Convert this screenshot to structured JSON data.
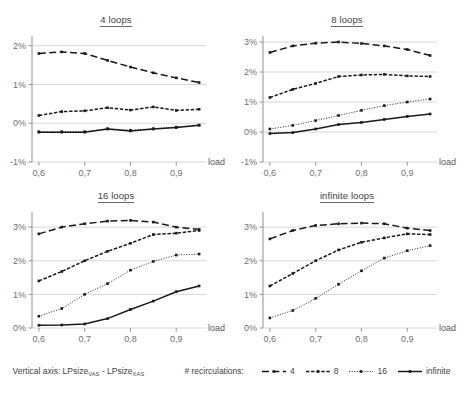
{
  "figure": {
    "legend": {
      "vertical_axis_text_prefix": "Vertical axis: LPsize",
      "vertical_axis_sub1": "VAS",
      "vertical_axis_middle": " - LPsize",
      "vertical_axis_sub2": "XAS",
      "recirculations_label": "# recirculations:",
      "entries": [
        {
          "label": "4",
          "style": "dashed"
        },
        {
          "label": "8",
          "style": "dash-dot"
        },
        {
          "label": "16",
          "style": "dotted"
        },
        {
          "label": "infinite",
          "style": "solid"
        }
      ]
    },
    "series_styles": {
      "4": "dashed",
      "8": "dash-dot",
      "16": "dotted",
      "infinite": "solid"
    },
    "color": "#1a1a1a",
    "gridline_color": "#d6d6d6",
    "axis_color": "#9a9a9a"
  },
  "chart_data": [
    {
      "type": "line",
      "title": "4 loops",
      "xlabel": "load",
      "ylabel": "",
      "x": [
        0.6,
        0.65,
        0.7,
        0.75,
        0.8,
        0.85,
        0.9,
        0.95
      ],
      "xticks": [
        "0,6",
        "0,7",
        "0,8",
        "0,9"
      ],
      "xtick_values": [
        0.6,
        0.7,
        0.8,
        0.9
      ],
      "xlim": [
        0.585,
        0.965
      ],
      "yticks": [
        "-1%",
        "0%",
        "1%",
        "2%"
      ],
      "ytick_values": [
        -1,
        0,
        1,
        2
      ],
      "ylim": [
        -1,
        2.25
      ],
      "grid": true,
      "legend_position": "figure-bottom",
      "series": [
        {
          "name": "4",
          "values": [
            1.8,
            1.84,
            1.8,
            1.62,
            1.45,
            1.3,
            1.17,
            1.05
          ]
        },
        {
          "name": "8",
          "values": [
            0.2,
            0.3,
            0.32,
            0.4,
            0.34,
            0.42,
            0.33,
            0.36
          ]
        },
        {
          "name": "16",
          "values": [
            -0.22,
            -0.22,
            -0.22,
            -0.14,
            -0.18,
            -0.14,
            -0.1,
            -0.05
          ]
        },
        {
          "name": "infinite",
          "values": [
            -0.23,
            -0.23,
            -0.23,
            -0.15,
            -0.2,
            -0.15,
            -0.11,
            -0.05
          ]
        }
      ]
    },
    {
      "type": "line",
      "title": "8 loops",
      "xlabel": "load",
      "ylabel": "",
      "x": [
        0.6,
        0.65,
        0.7,
        0.75,
        0.8,
        0.85,
        0.9,
        0.95
      ],
      "xticks": [
        "0,6",
        "0,7",
        "0,8",
        "0,9"
      ],
      "xtick_values": [
        0.6,
        0.7,
        0.8,
        0.9
      ],
      "xlim": [
        0.585,
        0.965
      ],
      "yticks": [
        "-1%",
        "0%",
        "1%",
        "2%",
        "3%"
      ],
      "ytick_values": [
        -1,
        0,
        1,
        2,
        3
      ],
      "ylim": [
        -1,
        3.2
      ],
      "grid": true,
      "legend_position": "figure-bottom",
      "series": [
        {
          "name": "4",
          "values": [
            2.65,
            2.87,
            2.96,
            3.0,
            2.95,
            2.87,
            2.75,
            2.55
          ]
        },
        {
          "name": "8",
          "values": [
            1.15,
            1.42,
            1.62,
            1.85,
            1.9,
            1.92,
            1.87,
            1.85
          ]
        },
        {
          "name": "16",
          "values": [
            0.1,
            0.22,
            0.38,
            0.55,
            0.72,
            0.88,
            1.0,
            1.1
          ]
        },
        {
          "name": "infinite",
          "values": [
            -0.05,
            -0.02,
            0.1,
            0.25,
            0.32,
            0.42,
            0.52,
            0.6
          ]
        }
      ]
    },
    {
      "type": "line",
      "title": "16 loops",
      "xlabel": "load",
      "ylabel": "",
      "x": [
        0.6,
        0.65,
        0.7,
        0.75,
        0.8,
        0.85,
        0.9,
        0.95
      ],
      "xticks": [
        "0,6",
        "0,7",
        "0,8",
        "0,9"
      ],
      "xtick_values": [
        0.6,
        0.7,
        0.8,
        0.9
      ],
      "xlim": [
        0.585,
        0.965
      ],
      "yticks": [
        "0%",
        "1%",
        "2%",
        "3%"
      ],
      "ytick_values": [
        0,
        1,
        2,
        3
      ],
      "ylim": [
        0,
        3.45
      ],
      "grid": true,
      "legend_position": "figure-bottom",
      "series": [
        {
          "name": "4",
          "values": [
            2.8,
            3.0,
            3.1,
            3.18,
            3.2,
            3.15,
            3.0,
            2.93
          ]
        },
        {
          "name": "8",
          "values": [
            1.4,
            1.68,
            2.0,
            2.28,
            2.52,
            2.78,
            2.82,
            2.9
          ]
        },
        {
          "name": "16",
          "values": [
            0.35,
            0.58,
            1.0,
            1.32,
            1.72,
            1.98,
            2.17,
            2.2
          ]
        },
        {
          "name": "infinite",
          "values": [
            0.08,
            0.09,
            0.12,
            0.28,
            0.55,
            0.8,
            1.08,
            1.25
          ]
        }
      ]
    },
    {
      "type": "line",
      "title": "infinite loops",
      "xlabel": "load",
      "ylabel": "",
      "x": [
        0.6,
        0.65,
        0.7,
        0.75,
        0.8,
        0.85,
        0.9,
        0.95
      ],
      "xticks": [
        "0,6",
        "0,7",
        "0,8",
        "0,9"
      ],
      "xtick_values": [
        0.6,
        0.7,
        0.8,
        0.9
      ],
      "xlim": [
        0.585,
        0.965
      ],
      "yticks": [
        "0%",
        "1%",
        "2%",
        "3%"
      ],
      "ytick_values": [
        0,
        1,
        2,
        3
      ],
      "ylim": [
        0,
        3.45
      ],
      "grid": true,
      "legend_position": "figure-bottom",
      "series": [
        {
          "name": "4",
          "values": [
            2.65,
            2.9,
            3.05,
            3.1,
            3.12,
            3.1,
            2.97,
            2.9
          ]
        },
        {
          "name": "8",
          "values": [
            1.25,
            1.62,
            2.0,
            2.32,
            2.55,
            2.68,
            2.8,
            2.78
          ]
        },
        {
          "name": "16",
          "values": [
            0.3,
            0.52,
            0.88,
            1.3,
            1.7,
            2.08,
            2.3,
            2.45
          ]
        }
      ]
    }
  ]
}
